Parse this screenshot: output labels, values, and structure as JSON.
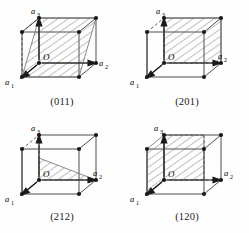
{
  "figure": {
    "kind": "crystallographic-plane-diagrams",
    "layout": {
      "rows": 2,
      "cols": 2,
      "width": 249,
      "height": 233
    },
    "colors": {
      "background": "#fefefe",
      "edge": "#3a3a3a",
      "hidden_edge": "#3a3a3a",
      "hatch": "#6d6d6d",
      "vertex": "#1a1a1a",
      "text": "#1a1a1a"
    },
    "axis_labels": {
      "a1": "a₁",
      "a2": "a₂",
      "a3": "a₃"
    },
    "origin_label": "O"
  },
  "panels": [
    {
      "id": "panel-011",
      "caption": "(011)",
      "miller_index": "(011)",
      "plane_shape": "parallelogram",
      "axes_shown": [
        "a₁",
        "a₂",
        "a₃"
      ],
      "origin_label": "O",
      "labels": {
        "a1": "a₁",
        "a2": "a₂",
        "a3": "a₃",
        "origin": "O"
      }
    },
    {
      "id": "panel-201",
      "caption": "(201)",
      "miller_index": "(201)",
      "plane_shape": "parallelogram",
      "axes_shown": [
        "a₁",
        "a₂",
        "a₃"
      ],
      "origin_label": "O",
      "labels": {
        "a1": "a₁",
        "a2": "a₂",
        "a3": "a₃",
        "origin": "O"
      }
    },
    {
      "id": "panel-212",
      "caption": "(212)",
      "miller_index": "(212)",
      "plane_shape": "triangle",
      "axes_shown": [
        "a₁",
        "a₂",
        "a₃"
      ],
      "origin_label": "O",
      "labels": {
        "a1": "a₁",
        "a2": "a₂",
        "a3": "a₃",
        "origin": "O"
      }
    },
    {
      "id": "panel-120",
      "caption": "(120)",
      "miller_index": "(120)",
      "plane_shape": "parallelogram",
      "axes_shown": [
        "a₁",
        "a₂",
        "a₃"
      ],
      "origin_label": "O",
      "labels": {
        "a1": "a₁",
        "a2": "a₂",
        "a3": "a₃",
        "origin": "O"
      }
    }
  ]
}
